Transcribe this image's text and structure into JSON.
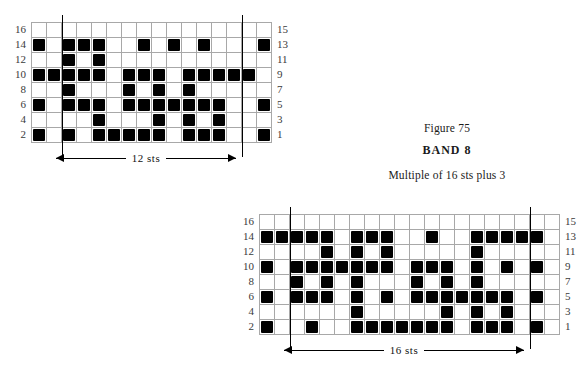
{
  "caption": {
    "figure": "Figure 75",
    "band": "BAND 8",
    "multiple": "Multiple of 16 sts plus 3"
  },
  "charts": [
    {
      "id": "top-chart",
      "name": "chart-upper",
      "columns": 16,
      "rows": 8,
      "cell_size": 15,
      "left_labels": [
        "16",
        "14",
        "12",
        "10",
        "8",
        "6",
        "4",
        "2"
      ],
      "right_labels": [
        "15",
        "13",
        "11",
        "9",
        "7",
        "5",
        "3",
        "1"
      ],
      "repeat_label": "12 sts",
      "repeat_start_col": 3,
      "repeat_end_col": 15,
      "grid": [
        [
          0,
          0,
          0,
          0,
          0,
          0,
          0,
          0,
          0,
          0,
          0,
          0,
          0,
          0,
          0,
          0
        ],
        [
          1,
          0,
          1,
          1,
          1,
          0,
          0,
          1,
          0,
          1,
          0,
          1,
          0,
          0,
          0,
          1
        ],
        [
          0,
          0,
          1,
          0,
          1,
          0,
          0,
          0,
          0,
          0,
          0,
          0,
          0,
          0,
          0,
          0
        ],
        [
          1,
          1,
          1,
          1,
          1,
          0,
          1,
          1,
          1,
          0,
          1,
          1,
          1,
          1,
          1,
          0
        ],
        [
          0,
          0,
          1,
          0,
          0,
          0,
          1,
          0,
          1,
          0,
          1,
          0,
          0,
          0,
          0,
          0
        ],
        [
          1,
          0,
          1,
          1,
          1,
          0,
          1,
          1,
          1,
          1,
          1,
          1,
          1,
          0,
          0,
          1
        ],
        [
          0,
          0,
          0,
          0,
          1,
          0,
          0,
          0,
          1,
          0,
          1,
          0,
          1,
          0,
          0,
          0
        ],
        [
          1,
          0,
          1,
          0,
          1,
          1,
          1,
          1,
          1,
          0,
          1,
          1,
          1,
          0,
          0,
          1
        ]
      ]
    },
    {
      "id": "bottom-chart",
      "name": "chart-lower",
      "columns": 20,
      "rows": 8,
      "cell_size": 15,
      "left_labels": [
        "16",
        "14",
        "12",
        "10",
        "8",
        "6",
        "4",
        "2"
      ],
      "right_labels": [
        "15",
        "13",
        "11",
        "9",
        "7",
        "5",
        "3",
        "1"
      ],
      "repeat_label": "16 sts",
      "repeat_start_col": 3,
      "repeat_end_col": 19,
      "grid": [
        [
          0,
          0,
          0,
          0,
          0,
          0,
          0,
          0,
          0,
          0,
          0,
          0,
          0,
          0,
          0,
          0,
          0,
          0,
          0,
          0
        ],
        [
          1,
          1,
          1,
          1,
          1,
          0,
          1,
          1,
          1,
          0,
          0,
          1,
          0,
          0,
          1,
          1,
          1,
          1,
          1,
          0
        ],
        [
          0,
          0,
          0,
          0,
          1,
          0,
          1,
          0,
          1,
          0,
          0,
          0,
          0,
          0,
          1,
          0,
          0,
          0,
          0,
          0
        ],
        [
          1,
          0,
          1,
          1,
          1,
          1,
          1,
          1,
          1,
          0,
          1,
          1,
          1,
          0,
          1,
          0,
          1,
          0,
          1,
          0
        ],
        [
          0,
          0,
          1,
          0,
          1,
          0,
          1,
          0,
          0,
          0,
          1,
          0,
          1,
          0,
          1,
          0,
          0,
          0,
          0,
          0
        ],
        [
          1,
          0,
          1,
          1,
          1,
          0,
          1,
          0,
          1,
          0,
          1,
          1,
          1,
          1,
          1,
          1,
          1,
          0,
          1,
          0
        ],
        [
          0,
          0,
          0,
          0,
          0,
          0,
          1,
          0,
          0,
          0,
          0,
          0,
          1,
          0,
          1,
          0,
          1,
          0,
          0,
          0
        ],
        [
          1,
          0,
          0,
          1,
          0,
          0,
          1,
          1,
          1,
          1,
          1,
          1,
          1,
          0,
          1,
          1,
          1,
          0,
          1,
          0
        ]
      ]
    }
  ]
}
